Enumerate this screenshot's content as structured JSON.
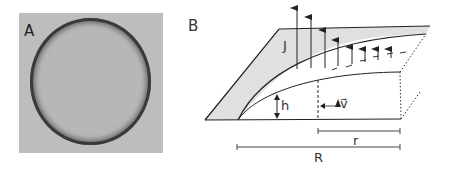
{
  "figure": {
    "panel_a": {
      "label": "A",
      "description": "Grayscale micrograph of a nearly circular droplet with dark rim"
    },
    "panel_b": {
      "label": "B",
      "symbols": {
        "flux": "J",
        "height": "h",
        "velocity": "v⃗",
        "radial_position": "r",
        "droplet_radius": "R"
      }
    }
  },
  "colors": {
    "photo_background": "#bdbdbd",
    "droplet_rim": "#3a3a3a",
    "shaded_region": "#e0e0e0",
    "line": "#222222"
  }
}
